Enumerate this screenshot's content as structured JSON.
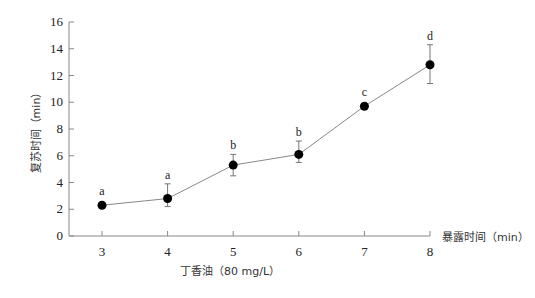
{
  "chart_data": {
    "type": "line",
    "title": "",
    "xlabel": "暴露时间（min）",
    "ylabel": "复苏时间（min）",
    "subtitle": "丁香油（80 mg/L）",
    "x": [
      3,
      4,
      5,
      6,
      7,
      8
    ],
    "xticks": [
      "3",
      "4",
      "5",
      "6",
      "7",
      "8"
    ],
    "yticks": [
      "0",
      "2",
      "4",
      "6",
      "8",
      "10",
      "12",
      "14",
      "16"
    ],
    "ylim": [
      0,
      16
    ],
    "grid": false,
    "legend": null,
    "series": [
      {
        "name": "丁香油（80 mg/L）",
        "values": [
          2.3,
          2.8,
          5.3,
          6.1,
          9.7,
          12.8
        ],
        "error_low": [
          2.3,
          2.2,
          4.5,
          5.5,
          9.5,
          11.4
        ],
        "error_high": [
          2.3,
          3.9,
          6.1,
          7.1,
          9.9,
          14.3
        ],
        "significance": [
          "a",
          "a",
          "b",
          "b",
          "c",
          "d"
        ]
      }
    ],
    "colors": {
      "axis": "#888888",
      "line": "#888888",
      "marker": "#000000"
    }
  }
}
